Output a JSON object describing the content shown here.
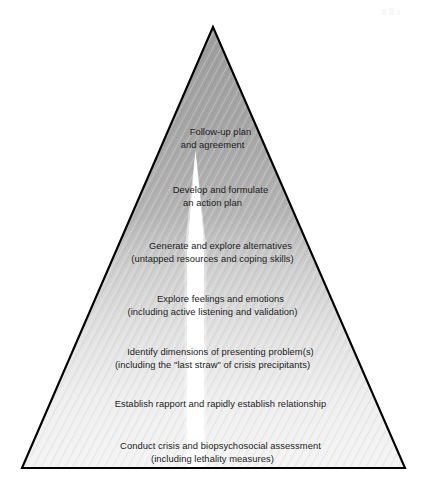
{
  "figure": {
    "name": "crisis-intervention-pyramid",
    "background_color": "#ffffff",
    "outline_color": "#000000",
    "fill_top_color": "#a3a3a3",
    "fill_bottom_color": "#f2f2f2",
    "wedge_color": "#ffffff",
    "text_color": "#1b1b1b",
    "apex": {
      "x": 213,
      "y": 27
    },
    "base_left": {
      "x": 22,
      "y": 468
    },
    "base_right": {
      "x": 405,
      "y": 468
    }
  },
  "tiers": [
    {
      "index": 1,
      "name": "follow-up-plan",
      "line1": "Follow-up plan",
      "line2": "and agreement",
      "top": 114
    },
    {
      "index": 2,
      "name": "develop-action-plan",
      "line1": "Develop and formulate",
      "line2": "an action plan",
      "top": 172
    },
    {
      "index": 3,
      "name": "generate-alternatives",
      "line1": "Generate and explore alternatives",
      "line2": "(untapped resources and coping skills)",
      "top": 228
    },
    {
      "index": 4,
      "name": "explore-feelings",
      "line1": "Explore feelings and emotions",
      "line2": "(including active listening and validation)",
      "top": 281
    },
    {
      "index": 5,
      "name": "identify-dimensions",
      "line1": "Identify dimensions of presenting problem(s)",
      "line2": "(including the \"last straw\" of crisis precipitants)",
      "top": 334
    },
    {
      "index": 6,
      "name": "establish-rapport",
      "line1": "Establish rapport and rapidly establish relationship",
      "line2": "",
      "top": 386
    },
    {
      "index": 7,
      "name": "conduct-assessment",
      "line1": "Conduct crisis and biopsychosocial assessment",
      "line2": "(including lethality measures)",
      "top": 428
    }
  ]
}
